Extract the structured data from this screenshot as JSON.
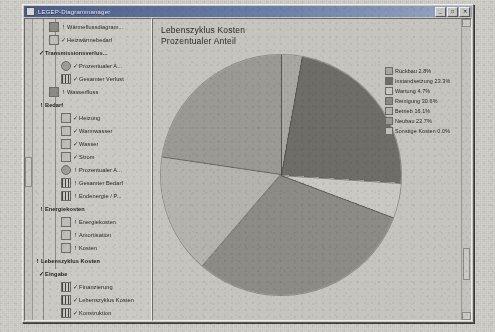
{
  "window": {
    "title": "LEGEP-Diagrammanager",
    "icon": "app-icon",
    "buttons": [
      {
        "name": "minimize",
        "glyph": "_"
      },
      {
        "name": "maximize",
        "glyph": "□"
      },
      {
        "name": "close",
        "glyph": "✕"
      }
    ]
  },
  "tree": {
    "items": [
      {
        "label": "Wärmeflussdiagram...",
        "indent": 2,
        "icon": "chart-icon",
        "mark": "!",
        "check": false,
        "bold": false,
        "selected": false
      },
      {
        "label": "Heizwärmebedarf",
        "indent": 2,
        "icon": "curve-icon",
        "mark": "",
        "check": true,
        "bold": false,
        "selected": false
      },
      {
        "label": "Transmissionsverlus...",
        "indent": 1,
        "icon": "none",
        "mark": "",
        "check": true,
        "bold": true,
        "selected": false
      },
      {
        "label": "Prozentualer A...",
        "indent": 3,
        "icon": "pie-icon",
        "mark": "",
        "check": true,
        "bold": false,
        "selected": false
      },
      {
        "label": "Gesamter Verlust",
        "indent": 3,
        "icon": "bar-icon",
        "mark": "",
        "check": true,
        "bold": false,
        "selected": false
      },
      {
        "label": "Wasserfluss",
        "indent": 2,
        "icon": "chart-icon",
        "mark": "!",
        "check": false,
        "bold": false,
        "selected": false
      },
      {
        "label": "Bedarf",
        "indent": 1,
        "icon": "none",
        "mark": "!",
        "check": false,
        "bold": true,
        "selected": false
      },
      {
        "label": "Heizung",
        "indent": 3,
        "icon": "h-icon",
        "mark": "",
        "check": true,
        "bold": false,
        "selected": false
      },
      {
        "label": "Warmwasser",
        "indent": 3,
        "icon": "rg-icon",
        "mark": "",
        "check": true,
        "bold": false,
        "selected": false
      },
      {
        "label": "Wasser",
        "indent": 3,
        "icon": "rg-icon",
        "mark": "",
        "check": true,
        "bold": false,
        "selected": false
      },
      {
        "label": "Strom",
        "indent": 3,
        "icon": "bolt-icon",
        "mark": "",
        "check": true,
        "bold": false,
        "selected": false
      },
      {
        "label": "Prozentualer A...",
        "indent": 3,
        "icon": "pie-icon",
        "mark": "!",
        "check": false,
        "bold": false,
        "selected": false
      },
      {
        "label": "Gesamter Bedarf",
        "indent": 3,
        "icon": "bar-icon",
        "mark": "!",
        "check": false,
        "bold": false,
        "selected": false
      },
      {
        "label": "Endenergie / P...",
        "indent": 3,
        "icon": "bar-icon",
        "mark": "!",
        "check": false,
        "bold": false,
        "selected": false
      },
      {
        "label": "Energiekosten",
        "indent": 1,
        "icon": "none",
        "mark": "!",
        "check": false,
        "bold": true,
        "selected": false
      },
      {
        "label": "Energiekosten",
        "indent": 3,
        "icon": "sheet-icon",
        "mark": "!",
        "check": false,
        "bold": false,
        "selected": false
      },
      {
        "label": "Amortisation",
        "indent": 3,
        "icon": "sheet-icon",
        "mark": "!",
        "check": false,
        "bold": false,
        "selected": false
      },
      {
        "label": "Kosten",
        "indent": 3,
        "icon": "curve-icon",
        "mark": "!",
        "check": false,
        "bold": false,
        "selected": false
      },
      {
        "label": "Lebenszyklus Kosten",
        "indent": 0,
        "icon": "none",
        "mark": "!",
        "check": false,
        "bold": true,
        "selected": false
      },
      {
        "label": "Eingabe",
        "indent": 1,
        "icon": "none",
        "mark": "",
        "check": true,
        "bold": true,
        "selected": false
      },
      {
        "label": "Finanzierung",
        "indent": 3,
        "icon": "bars-icon",
        "mark": "",
        "check": true,
        "bold": false,
        "selected": false
      },
      {
        "label": "Lebenszyklus Kosten",
        "indent": 3,
        "icon": "bars-icon",
        "mark": "",
        "check": true,
        "bold": false,
        "selected": false
      },
      {
        "label": "Konstruktion",
        "indent": 3,
        "icon": "bars-icon",
        "mark": "",
        "check": true,
        "bold": false,
        "selected": false
      },
      {
        "label": "Jährliche Kosten",
        "indent": 3,
        "icon": "bars-icon",
        "mark": "",
        "check": true,
        "bold": false,
        "selected": false
      },
      {
        "label": "Auswertung",
        "indent": 1,
        "icon": "none",
        "mark": "!",
        "check": false,
        "bold": true,
        "selected": false
      },
      {
        "label": "Folgekosten",
        "indent": 3,
        "icon": "pct-icon",
        "mark": "!",
        "check": false,
        "bold": false,
        "selected": false
      },
      {
        "label": "Kostenentwicklung",
        "indent": 3,
        "icon": "none",
        "mark": "",
        "check": true,
        "bold": false,
        "selected": false
      },
      {
        "label": "Prozentuale Kosten",
        "indent": 3,
        "icon": "pie-icon",
        "mark": "",
        "check": true,
        "bold": false,
        "selected": true
      },
      {
        "label": "Gesamtgebäude",
        "indent": 3,
        "icon": "bar-icon",
        "mark": "!",
        "check": false,
        "bold": false,
        "selected": false
      },
      {
        "label": "Folgekosten",
        "indent": 3,
        "icon": "bar-icon",
        "mark": "!",
        "check": false,
        "bold": false,
        "selected": false
      },
      {
        "label": "Monatliche Belastung",
        "indent": 3,
        "icon": "bars-icon",
        "mark": "",
        "check": true,
        "bold": false,
        "selected": false
      },
      {
        "label": "Kostengruppen",
        "indent": 1,
        "icon": "none",
        "mark": "!",
        "check": false,
        "bold": true,
        "selected": false
      },
      {
        "label": "Kostengruppen...",
        "indent": 3,
        "icon": "pie-icon",
        "mark": "",
        "check": true,
        "bold": false,
        "selected": false
      },
      {
        "label": "Absolute Werte",
        "indent": 3,
        "icon": "bars-icon",
        "mark": "!",
        "check": false,
        "bold": false,
        "selected": false
      },
      {
        "label": "Kostengruppen...",
        "indent": 3,
        "icon": "bars-icon",
        "mark": "!",
        "check": false,
        "bold": false,
        "selected": false
      },
      {
        "label": "Absolute Werte",
        "indent": 3,
        "icon": "bar-icon",
        "mark": "!",
        "check": false,
        "bold": false,
        "selected": false
      }
    ]
  },
  "chart_data": {
    "type": "pie",
    "title": "Lebenszyklus Kosten",
    "subtitle": "Prozentualer Anteil",
    "xlabel": "",
    "ylabel": "",
    "legend_position": "right",
    "grid": false,
    "categories": [
      "Rückbau",
      "Instandsetzung",
      "Wartung",
      "Reinigung",
      "Betrieb",
      "Neubau",
      "Sonstige Kosten"
    ],
    "values": [
      2.8,
      23.3,
      4.7,
      30.6,
      16.1,
      22.7,
      0.0
    ],
    "labels": [
      "Rückbau 2.8%",
      "Instandsetzung 23.3%",
      "Wartung 4.7%",
      "Reinigung 30.6%",
      "Betrieb 16.1%",
      "Neubau 22.7%",
      "Sonstige Kosten 0.0%"
    ],
    "colors": [
      "#a9a7a1",
      "#6f6d68",
      "#cac8c2",
      "#8d8b86",
      "#b5b3ad",
      "#9b9994",
      "#c0beb8"
    ]
  }
}
